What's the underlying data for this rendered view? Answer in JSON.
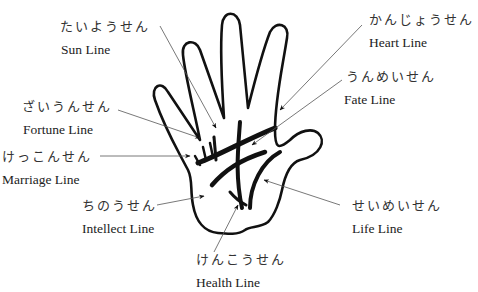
{
  "diagram": {
    "outline_color": "#111111",
    "leader_color": "#555555",
    "labels": [
      {
        "key": "sun",
        "jp": "たいようせん",
        "en": "Sun Line"
      },
      {
        "key": "heart",
        "jp": "かんじょうせん",
        "en": "Heart Line"
      },
      {
        "key": "fate",
        "jp": "うんめいせん",
        "en": "Fate Line"
      },
      {
        "key": "fortune",
        "jp": "ざいうんせん",
        "en": "Fortune Line"
      },
      {
        "key": "marriage",
        "jp": "けっこんせん",
        "en": "Marriage Line"
      },
      {
        "key": "intellect",
        "jp": "ちのうせん",
        "en": "Intellect Line"
      },
      {
        "key": "life",
        "jp": "せいめいせん",
        "en": "Life Line"
      },
      {
        "key": "health",
        "jp": "けんこうせん",
        "en": "Health Line"
      }
    ]
  }
}
